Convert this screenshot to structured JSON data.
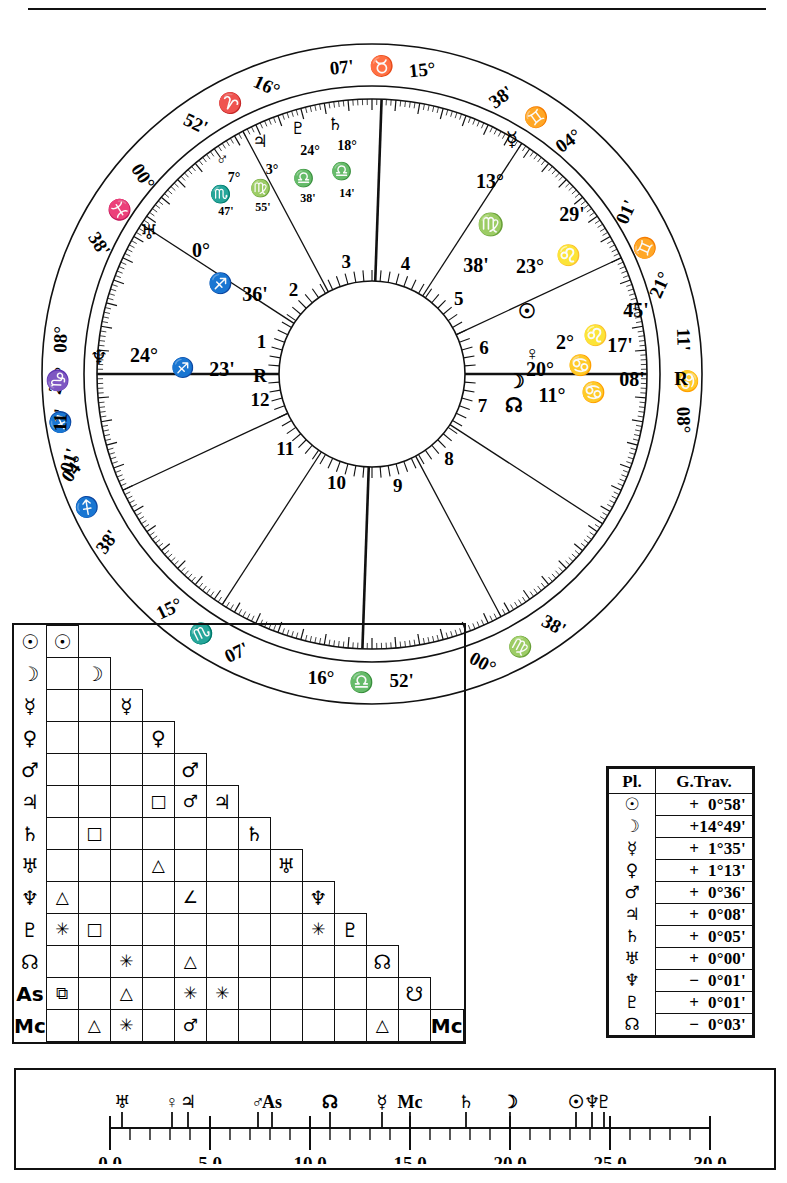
{
  "document": {
    "type": "astrological-natal-chart",
    "title": "Natal Chart Wheel with Aspect Grid and Daily Travel Table"
  },
  "wheel": {
    "angles": {
      "mc": {
        "deg": "16°",
        "sign": "♎",
        "min": "52'",
        "label": "Midheaven"
      },
      "ic": {
        "deg": "16°",
        "sign": "♈",
        "min": "52'",
        "label": "Imum Coeli"
      },
      "asc": {
        "deg": "08°",
        "sign": "♑",
        "min": "11'",
        "label": "Ascendant"
      },
      "dsc": {
        "deg": "08°",
        "sign": "♋",
        "min": "11'",
        "label": "Descendant"
      }
    },
    "cusps": [
      {
        "house": 11,
        "deg": "07°",
        "sign": "♏",
        "min": "15°",
        "outer_deg": "07'",
        "outer_sign": "♏",
        "outer_min": "15°"
      },
      {
        "house": 12,
        "deg": "04°",
        "sign": "♐",
        "min": "38'"
      },
      {
        "house": 1,
        "deg": "21°",
        "sign": "♐",
        "min": "01'"
      },
      {
        "house": 2,
        "deg": "08°",
        "sign": "♑",
        "min": "11'"
      },
      {
        "house": 9,
        "deg": "00°",
        "sign": "♍",
        "min": "38'"
      },
      {
        "house": 8,
        "deg": "29°",
        "sign": "",
        "min": ""
      },
      {
        "house": 7,
        "deg": "08°",
        "sign": "♋",
        "min": "11'"
      },
      {
        "house": 6,
        "deg": "21°",
        "sign": "♊",
        "min": "01'"
      },
      {
        "house": 5,
        "deg": "04°",
        "sign": "♊",
        "min": "38'"
      },
      {
        "house": 4,
        "deg": "15°",
        "sign": "♉",
        "min": "07'"
      },
      {
        "house": 3,
        "deg": "00°",
        "sign": "♓",
        "min": "38'"
      }
    ],
    "cusp_labels_outer": [
      {
        "id": "mc-top",
        "deg": "16°",
        "sign": "♎",
        "min": "52'"
      },
      {
        "id": "c11-left",
        "deg": "15°",
        "sign": "♏",
        "min": "07'"
      },
      {
        "id": "c12-left",
        "deg": "04°",
        "sign": "♐",
        "min": "38'"
      },
      {
        "id": "asc-left1",
        "deg": "21°",
        "sign": "♐",
        "min": "01'"
      },
      {
        "id": "asc-left2",
        "deg": "08°",
        "sign": "♑",
        "min": "11'"
      },
      {
        "id": "c3-bottomL",
        "deg": "00°",
        "sign": "♓",
        "min": "38'"
      },
      {
        "id": "ic-bottom",
        "deg": "16°",
        "sign": "♈",
        "min": "52'"
      },
      {
        "id": "c5-bottomR",
        "deg": "15°",
        "sign": "♉",
        "min": "07'"
      },
      {
        "id": "c5-right",
        "deg": "04°",
        "sign": "♊",
        "min": "38'"
      },
      {
        "id": "c6-right",
        "deg": "21°",
        "sign": "♊",
        "min": "01'"
      },
      {
        "id": "dsc-right",
        "deg": "08°",
        "sign": "♋",
        "min": "11'"
      },
      {
        "id": "c9-upperR",
        "deg": "00°",
        "sign": "♍",
        "min": "38'"
      }
    ],
    "house_numbers": [
      "1",
      "2",
      "3",
      "4",
      "5",
      "6",
      "7",
      "8",
      "9",
      "10",
      "11",
      "12"
    ],
    "inner_cusp_markers": [
      {
        "house": "10",
        "deg": "0°",
        "sign": "♐",
        "min": "36'"
      },
      {
        "house": "11",
        "deg": "24°",
        "sign": "♐",
        "min": "23'",
        "retro": "R",
        "planet": "♆"
      },
      {
        "house": "8",
        "deg": "13°",
        "sign": "♍",
        "min": "38'",
        "planet": "☿"
      },
      {
        "house": "9",
        "deg": "23°",
        "sign": "♌",
        "min": "29'",
        "planet": "☉"
      },
      {
        "house": "7a",
        "deg": "2°",
        "sign": "♌",
        "min": "45'",
        "planet": "♀"
      },
      {
        "house": "7b",
        "deg": "20°",
        "sign": "♋",
        "min": "17'",
        "planet": "☽"
      },
      {
        "house": "7c",
        "deg": "11°",
        "sign": "♋",
        "min": "08'",
        "retro": "R",
        "planet": "☊"
      },
      {
        "house": "12",
        "deg": "0°",
        "sign": "♐",
        "min": "",
        "planet": "♅"
      }
    ],
    "planets": [
      {
        "name": "mars",
        "glyph": "♂",
        "deg": "7°",
        "sign": "♏",
        "min": "47'"
      },
      {
        "name": "jupiter",
        "glyph": "♃",
        "deg": "3°",
        "sign": "♍",
        "min": "55'"
      },
      {
        "name": "pluto",
        "glyph": "♇",
        "deg": "24°",
        "sign": "♎",
        "min": "38'"
      },
      {
        "name": "saturn",
        "glyph": "♄",
        "deg": "18°",
        "sign": "♎",
        "min": "14'"
      },
      {
        "name": "mercury",
        "glyph": "☿",
        "deg": "13°",
        "sign": "♍",
        "min": "38'"
      },
      {
        "name": "sun",
        "glyph": "☉",
        "deg": "23°",
        "sign": "♌",
        "min": "29'"
      },
      {
        "name": "venus",
        "glyph": "♀",
        "deg": "2°",
        "sign": "♌",
        "min": "45'"
      },
      {
        "name": "moon",
        "glyph": "☽",
        "deg": "20°",
        "sign": "♋",
        "min": "17'"
      },
      {
        "name": "node",
        "glyph": "☊",
        "deg": "11°",
        "sign": "♋",
        "min": "08'",
        "retro": "R"
      },
      {
        "name": "uranus",
        "glyph": "♅",
        "deg": "0°",
        "sign": "♐",
        "min": "36'"
      },
      {
        "name": "neptune",
        "glyph": "♆",
        "deg": "24°",
        "sign": "♐",
        "min": "23'",
        "retro": "R"
      }
    ]
  },
  "aspect_grid": {
    "row_labels": [
      "☉",
      "☽",
      "☿",
      "♀",
      "♂",
      "♃",
      "♄",
      "♅",
      "♆",
      "♇",
      "☊",
      "Aѕ",
      "Mс"
    ],
    "planet_names": [
      "Sun",
      "Moon",
      "Mercury",
      "Venus",
      "Mars",
      "Jupiter",
      "Saturn",
      "Uranus",
      "Neptune",
      "Pluto",
      "Node",
      "Ascendant",
      "Midheaven"
    ],
    "rows": [
      {
        "label": "☉",
        "cells": [],
        "diag": "☉"
      },
      {
        "label": "☽",
        "cells": [
          ""
        ],
        "diag": "☽"
      },
      {
        "label": "☿",
        "cells": [
          "",
          ""
        ],
        "diag": "☿"
      },
      {
        "label": "♀",
        "cells": [
          "",
          "",
          ""
        ],
        "diag": "♀"
      },
      {
        "label": "♂",
        "cells": [
          "",
          "",
          "",
          ""
        ],
        "diag": "♂"
      },
      {
        "label": "♃",
        "cells": [
          "",
          "",
          "",
          "□",
          "♂"
        ],
        "diag": "♃"
      },
      {
        "label": "♄",
        "cells": [
          "",
          "□",
          "",
          "",
          "",
          ""
        ],
        "diag": "♄"
      },
      {
        "label": "♅",
        "cells": [
          "",
          "",
          "",
          "△",
          "",
          "",
          ""
        ],
        "diag": "♅"
      },
      {
        "label": "♆",
        "cells": [
          "△",
          "",
          "",
          "",
          "∠",
          "",
          "",
          ""
        ],
        "diag": "♆"
      },
      {
        "label": "♇",
        "cells": [
          "✳",
          "□",
          "",
          "",
          "",
          "",
          "",
          "",
          "✳"
        ],
        "diag": "♇"
      },
      {
        "label": "☊",
        "cells": [
          "",
          "",
          "✳",
          "",
          "△",
          "",
          "",
          "",
          "",
          ""
        ],
        "diag": "☊"
      },
      {
        "label": "Aѕ",
        "cells": [
          "⧉",
          "",
          "△",
          "",
          "✳",
          "✳",
          "",
          "",
          "",
          "",
          ""
        ],
        "diag": "☋"
      },
      {
        "label": "Mс",
        "cells": [
          "",
          "△",
          "✳",
          "",
          "♂",
          "",
          "",
          "",
          "",
          "",
          "△",
          ""
        ],
        "diag": "Mс"
      }
    ]
  },
  "gtrav_table": {
    "header": {
      "pl": "Pl.",
      "travel": "G.Trav."
    },
    "rows": [
      {
        "glyph": "☉",
        "name": "Sun",
        "value": "+  0°58'"
      },
      {
        "glyph": "☽",
        "name": "Moon",
        "value": "+14°49'"
      },
      {
        "glyph": "☿",
        "name": "Mercury",
        "value": "+  1°35'"
      },
      {
        "glyph": "♀",
        "name": "Venus",
        "value": "+  1°13'"
      },
      {
        "glyph": "♂",
        "name": "Mars",
        "value": "+  0°36'"
      },
      {
        "glyph": "♃",
        "name": "Jupiter",
        "value": "+  0°08'"
      },
      {
        "glyph": "♄",
        "name": "Saturn",
        "value": "+  0°05'"
      },
      {
        "glyph": "♅",
        "name": "Uranus",
        "value": "+  0°00'"
      },
      {
        "glyph": "♆",
        "name": "Neptune",
        "value": "−  0°01'"
      },
      {
        "glyph": "♇",
        "name": "Pluto",
        "value": "+  0°01'"
      },
      {
        "glyph": "☊",
        "name": "Node",
        "value": "−  0°03'"
      }
    ]
  },
  "ruler": {
    "axis_min": 0.0,
    "axis_max": 30.0,
    "tick_labels": [
      "0.0",
      "5.0",
      "10.0",
      "15.0",
      "20.0",
      "25.0",
      "30.0"
    ],
    "tick_values": [
      0.0,
      5.0,
      10.0,
      15.0,
      20.0,
      25.0,
      30.0
    ],
    "minor_step": 1.0,
    "markers": [
      {
        "glyph": "♅",
        "name": "Uranus",
        "value": 0.6
      },
      {
        "glyph": "♀",
        "name": "Venus",
        "value": 3.1
      },
      {
        "glyph": "♃",
        "name": "Jupiter",
        "value": 3.9
      },
      {
        "glyph": "♂",
        "name": "Mars",
        "value": 7.4
      },
      {
        "glyph": "Aѕ",
        "name": "Ascendant",
        "value": 8.1
      },
      {
        "glyph": "☊",
        "name": "Node",
        "value": 11.0
      },
      {
        "glyph": "☿",
        "name": "Mercury",
        "value": 13.6
      },
      {
        "glyph": "Mс",
        "name": "Midheaven",
        "value": 15.0
      },
      {
        "glyph": "♄",
        "name": "Saturn",
        "value": 17.8
      },
      {
        "glyph": "☽",
        "name": "Moon",
        "value": 20.0
      },
      {
        "glyph": "☉",
        "name": "Sun",
        "value": 23.3
      },
      {
        "glyph": "♆",
        "name": "Neptune",
        "value": 24.1
      },
      {
        "glyph": "♇",
        "name": "Pluto",
        "value": 24.7
      }
    ]
  }
}
